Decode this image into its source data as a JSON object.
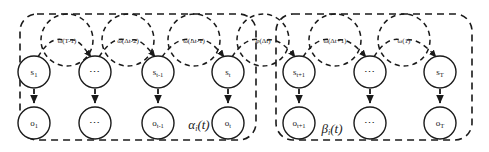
{
  "figure": {
    "type": "probabilistic-graphical-model",
    "colors": {
      "stroke": "#1a1a1a",
      "background": "#ffffff"
    }
  },
  "plates": [
    {
      "id": "alpha",
      "label": "α",
      "sub": "i",
      "suffix": "(t)",
      "x": 20,
      "y": 14,
      "w": 236,
      "h": 126
    },
    {
      "id": "beta",
      "label": "β",
      "sub": "i",
      "suffix": "(t)",
      "x": 276,
      "y": 14,
      "w": 196,
      "h": 126
    }
  ],
  "plate_labels": {
    "alpha_full": "αi(t)",
    "beta_full": "βi(t)"
  },
  "columns": [
    {
      "id": "col1",
      "cx": 34,
      "omega": {
        "id": "omega-t-minus-1",
        "label": "ω(T-1)",
        "cx": 67,
        "cy": 40,
        "r": 26
      },
      "state": {
        "id": "state-s1",
        "base": "s",
        "sub": "1",
        "cx": 34,
        "cy": 72,
        "r": 16
      },
      "obs": {
        "id": "obs-o1",
        "base": "o",
        "sub": "1",
        "cx": 34,
        "cy": 123,
        "r": 16
      }
    },
    {
      "id": "col2",
      "cx": 95,
      "omega": {
        "id": "omega-delta-t-minus-2",
        "label": "ω(Δt-2)",
        "cx": 128,
        "cy": 40,
        "r": 26
      },
      "state": {
        "id": "state-s-ellipsis-left",
        "base": "…",
        "sub": "",
        "cx": 95,
        "cy": 72,
        "r": 16
      },
      "obs": {
        "id": "obs-o-ellipsis-left",
        "base": "…",
        "sub": "",
        "cx": 95,
        "cy": 123,
        "r": 16
      }
    },
    {
      "id": "col3",
      "cx": 158,
      "omega": {
        "id": "omega-delta-t-minus-1",
        "label": "ω(Δt-1)",
        "cx": 194,
        "cy": 40,
        "r": 26
      },
      "state": {
        "id": "state-s-t-minus-1",
        "base": "s",
        "sub": "t-1",
        "cx": 158,
        "cy": 72,
        "r": 16
      },
      "obs": {
        "id": "obs-o-t-minus-1",
        "base": "o",
        "sub": "t-1",
        "cx": 158,
        "cy": 123,
        "r": 16
      }
    },
    {
      "id": "col4",
      "cx": 228,
      "omega": {
        "id": "omega-phi-delta-t",
        "label": "φ(Δt)",
        "cx": 263,
        "cy": 40,
        "r": 26
      },
      "state": {
        "id": "state-s-t",
        "base": "s",
        "sub": "t",
        "cx": 228,
        "cy": 72,
        "r": 16
      },
      "obs": {
        "id": "obs-o-t",
        "base": "o",
        "sub": "t",
        "cx": 228,
        "cy": 123,
        "r": 16
      }
    },
    {
      "id": "col5",
      "cx": 299,
      "omega": {
        "id": "omega-delta-t-plus-1",
        "label": "ω(Δt+1)",
        "cx": 335,
        "cy": 40,
        "r": 26
      },
      "state": {
        "id": "state-s-t-plus-1",
        "base": "s",
        "sub": "t+1",
        "cx": 299,
        "cy": 72,
        "r": 16
      },
      "obs": {
        "id": "obs-o-t-plus-1",
        "base": "o",
        "sub": "t+1",
        "cx": 299,
        "cy": 123,
        "r": 16
      }
    },
    {
      "id": "col6",
      "cx": 370,
      "omega": {
        "id": "omega-1",
        "label": "ω(1)",
        "cx": 404,
        "cy": 40,
        "r": 26
      },
      "state": {
        "id": "state-s-ellipsis-right",
        "base": "…",
        "sub": "",
        "cx": 370,
        "cy": 72,
        "r": 16
      },
      "obs": {
        "id": "obs-o-ellipsis-right",
        "base": "…",
        "sub": "",
        "cx": 370,
        "cy": 123,
        "r": 16
      }
    },
    {
      "id": "col7",
      "cx": 440,
      "omega": null,
      "state": {
        "id": "state-s-T",
        "base": "s",
        "sub": "T",
        "cx": 440,
        "cy": 72,
        "r": 16
      },
      "obs": {
        "id": "obs-o-T",
        "base": "o",
        "sub": "T",
        "cx": 440,
        "cy": 123,
        "r": 16
      }
    }
  ],
  "omega_nodes": [
    {
      "id": "omega-t-minus-1",
      "label": "ω(T-1)"
    },
    {
      "id": "omega-delta-t-minus-2",
      "label": "ω(Δt-2)"
    },
    {
      "id": "omega-delta-t-minus-1",
      "label": "ω(Δt-1)"
    },
    {
      "id": "omega-phi-delta-t",
      "label": "φ(Δt)"
    },
    {
      "id": "omega-delta-t-plus-1",
      "label": "ω(Δt+1)"
    },
    {
      "id": "omega-1",
      "label": "ω(1)"
    }
  ],
  "state_nodes": [
    {
      "base": "s",
      "sub": "1"
    },
    {
      "base": "⋯",
      "sub": ""
    },
    {
      "base": "s",
      "sub": "t-1"
    },
    {
      "base": "s",
      "sub": "t"
    },
    {
      "base": "s",
      "sub": "t+1"
    },
    {
      "base": "⋯",
      "sub": ""
    },
    {
      "base": "s",
      "sub": "T"
    }
  ],
  "obs_nodes": [
    {
      "base": "o",
      "sub": "1"
    },
    {
      "base": "⋯",
      "sub": ""
    },
    {
      "base": "o",
      "sub": "t-1"
    },
    {
      "base": "o",
      "sub": "t"
    },
    {
      "base": "o",
      "sub": "t+1"
    },
    {
      "base": "⋯",
      "sub": ""
    },
    {
      "base": "o",
      "sub": "T"
    }
  ],
  "ellipsis_glyph": "⋯"
}
